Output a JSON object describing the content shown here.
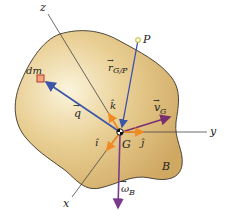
{
  "figure": {
    "body_label": "B",
    "point_G": "G",
    "point_P": "P",
    "mass_element": "dm",
    "axes": {
      "x": "x",
      "y": "y",
      "z": "z"
    },
    "unit_vectors": {
      "i": "î",
      "j": "ĵ",
      "k": "k̂"
    },
    "vectors": {
      "r_GP": {
        "symbol": "r",
        "subscript": "G/P",
        "arrow": "→"
      },
      "q": {
        "symbol": "q",
        "arrow": "→"
      },
      "v_G": {
        "symbol": "v",
        "subscript": "G",
        "arrow": "→"
      },
      "omega_B": {
        "symbol": "ω",
        "subscript": "B",
        "arrow": "→"
      }
    },
    "colors": {
      "body_fill_light": "#f6ecc6",
      "body_fill_dark": "#d4b06a",
      "body_outline": "#3a3226",
      "axis": "#444444",
      "r_vector": "#3b4fb0",
      "q_vector": "#3b55a8",
      "unit_vector": "#f08a24",
      "v_vector": "#7a2f6e",
      "omega_vector": "#7a3a8c",
      "dm_fill": "#f2a57e",
      "dm_stroke": "#b13a2a",
      "P_marker": "#c9c23a"
    }
  }
}
